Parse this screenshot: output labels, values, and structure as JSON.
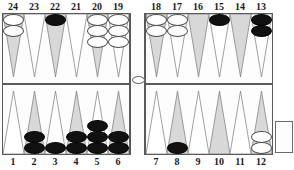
{
  "board": {
    "title": "Backgammon board",
    "colors": {
      "white_checker": "#ffffff",
      "black_checker": "#111111",
      "point_shaded": "#d8d8d8",
      "point_plain": "#ffffff",
      "frame": "#5a5a5a",
      "label": "#1c1c1c",
      "background": "#ffffff"
    },
    "point_numbers_top": [
      "24",
      "23",
      "22",
      "21",
      "20",
      "19",
      "18",
      "17",
      "16",
      "15",
      "14",
      "13"
    ],
    "point_numbers_bottom": [
      "1",
      "2",
      "3",
      "4",
      "5",
      "6",
      "7",
      "8",
      "9",
      "10",
      "11",
      "12"
    ],
    "bar": {
      "white_count": 1,
      "black_count": 0
    },
    "trays": {
      "bottom_right_label": ""
    },
    "points": [
      {
        "number": "24",
        "row": "top",
        "quadrant": "top-left",
        "index": 0,
        "shade": "shaded",
        "color": "white",
        "count": 2
      },
      {
        "number": "23",
        "row": "top",
        "quadrant": "top-left",
        "index": 1,
        "shade": "plain",
        "color": "none",
        "count": 0
      },
      {
        "number": "22",
        "row": "top",
        "quadrant": "top-left",
        "index": 2,
        "shade": "shaded",
        "color": "black",
        "count": 1
      },
      {
        "number": "21",
        "row": "top",
        "quadrant": "top-left",
        "index": 3,
        "shade": "plain",
        "color": "none",
        "count": 0
      },
      {
        "number": "20",
        "row": "top",
        "quadrant": "top-left",
        "index": 4,
        "shade": "shaded",
        "color": "white",
        "count": 3
      },
      {
        "number": "19",
        "row": "top",
        "quadrant": "top-left",
        "index": 5,
        "shade": "plain",
        "color": "white",
        "count": 3
      },
      {
        "number": "18",
        "row": "top",
        "quadrant": "top-right",
        "index": 0,
        "shade": "shaded",
        "color": "white",
        "count": 2
      },
      {
        "number": "17",
        "row": "top",
        "quadrant": "top-right",
        "index": 1,
        "shade": "plain",
        "color": "white",
        "count": 2
      },
      {
        "number": "16",
        "row": "top",
        "quadrant": "top-right",
        "index": 2,
        "shade": "shaded",
        "color": "none",
        "count": 0
      },
      {
        "number": "15",
        "row": "top",
        "quadrant": "top-right",
        "index": 3,
        "shade": "plain",
        "color": "black",
        "count": 1
      },
      {
        "number": "14",
        "row": "top",
        "quadrant": "top-right",
        "index": 4,
        "shade": "shaded",
        "color": "none",
        "count": 0
      },
      {
        "number": "13",
        "row": "top",
        "quadrant": "top-right",
        "index": 5,
        "shade": "plain",
        "color": "black",
        "count": 2
      },
      {
        "number": "1",
        "row": "bottom",
        "quadrant": "bottom-left",
        "index": 0,
        "shade": "plain",
        "color": "none",
        "count": 0
      },
      {
        "number": "2",
        "row": "bottom",
        "quadrant": "bottom-left",
        "index": 1,
        "shade": "shaded",
        "color": "black",
        "count": 2
      },
      {
        "number": "3",
        "row": "bottom",
        "quadrant": "bottom-left",
        "index": 2,
        "shade": "plain",
        "color": "black",
        "count": 1
      },
      {
        "number": "4",
        "row": "bottom",
        "quadrant": "bottom-left",
        "index": 3,
        "shade": "shaded",
        "color": "black",
        "count": 2
      },
      {
        "number": "5",
        "row": "bottom",
        "quadrant": "bottom-left",
        "index": 4,
        "shade": "plain",
        "color": "black",
        "count": 3
      },
      {
        "number": "6",
        "row": "bottom",
        "quadrant": "bottom-left",
        "index": 5,
        "shade": "shaded",
        "color": "black",
        "count": 2
      },
      {
        "number": "7",
        "row": "bottom",
        "quadrant": "bottom-right",
        "index": 0,
        "shade": "plain",
        "color": "none",
        "count": 0
      },
      {
        "number": "8",
        "row": "bottom",
        "quadrant": "bottom-right",
        "index": 1,
        "shade": "shaded",
        "color": "black",
        "count": 1
      },
      {
        "number": "9",
        "row": "bottom",
        "quadrant": "bottom-right",
        "index": 2,
        "shade": "plain",
        "color": "none",
        "count": 0
      },
      {
        "number": "10",
        "row": "bottom",
        "quadrant": "bottom-right",
        "index": 3,
        "shade": "shaded",
        "color": "none",
        "count": 0
      },
      {
        "number": "11",
        "row": "bottom",
        "quadrant": "bottom-right",
        "index": 4,
        "shade": "plain",
        "color": "none",
        "count": 0
      },
      {
        "number": "12",
        "row": "bottom",
        "quadrant": "bottom-right",
        "index": 5,
        "shade": "shaded",
        "color": "white",
        "count": 2
      }
    ]
  }
}
